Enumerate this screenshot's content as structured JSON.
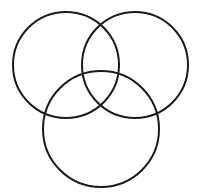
{
  "figure": {
    "name": "three-overlapping-circles",
    "width": 202,
    "height": 196,
    "background_color": "#ffffff",
    "stroke_color": "#1a1a1a",
    "stroke_width": 2,
    "fill": "none",
    "circle_count": 3,
    "arrangement": "triangular-venn"
  },
  "chart_data": {
    "type": "diagram",
    "title": "",
    "subtitle": "",
    "xlabel": "",
    "ylabel": "",
    "legend": [],
    "annotations": [],
    "grid": false,
    "shapes": [
      {
        "id": "circle-top-left",
        "label": "top-left circle",
        "cx": 66,
        "cy": 65,
        "r": 53,
        "stroke": "#1a1a1a",
        "stroke_width": 2,
        "fill": "none"
      },
      {
        "id": "circle-top-right",
        "label": "top-right circle",
        "cx": 135,
        "cy": 65,
        "r": 53,
        "stroke": "#1a1a1a",
        "stroke_width": 2,
        "fill": "none"
      },
      {
        "id": "circle-bottom-center",
        "label": "bottom-center circle",
        "cx": 101,
        "cy": 129,
        "r": 58,
        "stroke": "#1a1a1a",
        "stroke_width": 2,
        "fill": "none"
      }
    ]
  }
}
